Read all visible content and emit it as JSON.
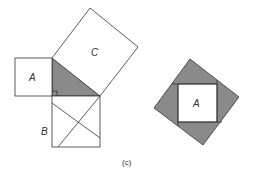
{
  "figure": {
    "caption": "(c)",
    "colors": {
      "stroke": "#333333",
      "shaded": "#8a8a8a",
      "background": "#ffffff"
    },
    "left_figure": {
      "square_a_label": "A",
      "square_b_label": "B",
      "square_c_label": "C"
    },
    "right_figure": {
      "inner_square_label": "A"
    }
  }
}
